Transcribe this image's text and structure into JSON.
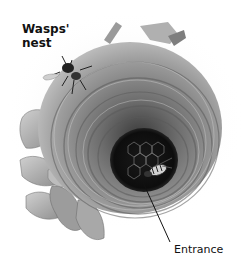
{
  "figure": {
    "title_label": "Wasps'\nnest",
    "entrance_label": "Entrance",
    "colors": {
      "background": "#ffffff",
      "nest_light": "#bdbdbd",
      "nest_mid": "#8a8a8a",
      "nest_dark": "#4a4a4a",
      "hole": "#111111",
      "leaf": "#a9a9a9",
      "text": "#111111"
    }
  }
}
